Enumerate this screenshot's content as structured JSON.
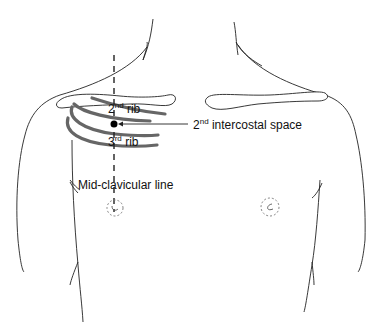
{
  "labels": {
    "rib2": {
      "base": "2",
      "sup": "nd",
      "rest": " rib"
    },
    "rib3": {
      "base": "3",
      "sup": "rd",
      "rest": " rib"
    },
    "intercostal": {
      "base": "2",
      "sup": "nd",
      "rest": " intercostal space"
    },
    "midclavicular": "Mid-clavicular line"
  },
  "colors": {
    "outline": "#222222",
    "rib": "#666666",
    "marker": "#000000"
  }
}
